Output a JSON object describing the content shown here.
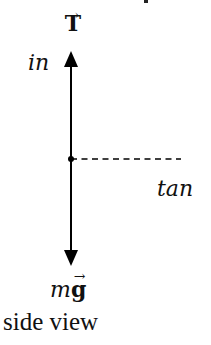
{
  "diagram": {
    "labels": {
      "tension": "T",
      "tension_arrow": "→",
      "inward_direction": "in",
      "tangential_direction": "tan",
      "weight_m": "m",
      "weight_g": "g",
      "weight_arrow": "→",
      "caption": "side view"
    },
    "forces": [
      {
        "name": "tension",
        "symbol": "T",
        "direction": "up",
        "vector": true
      },
      {
        "name": "weight",
        "symbol": "mg",
        "direction": "down",
        "vector": true
      }
    ],
    "axes": [
      {
        "name": "in",
        "style": "solid",
        "direction": "up"
      },
      {
        "name": "tan",
        "style": "dashed",
        "direction": "right"
      }
    ],
    "colors": {
      "stroke": "#000000",
      "background": "#ffffff"
    }
  }
}
